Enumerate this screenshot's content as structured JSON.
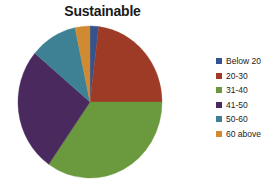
{
  "chart_data": {
    "type": "pie",
    "title": "Sustainable",
    "xlabel": "",
    "ylabel": "",
    "legend_position": "right",
    "grid": false,
    "categories": [
      "Below 20",
      "20-30",
      "31-40",
      "41-50",
      "50-60",
      "60 above"
    ],
    "values": [
      2,
      23,
      35,
      26,
      10,
      4
    ],
    "units": "percent",
    "colors": [
      "#34538F",
      "#9E3B26",
      "#6B993E",
      "#4A2A5E",
      "#3E8195",
      "#D08A32"
    ],
    "start_angle_deg": 0,
    "direction": "clockwise",
    "slices": [
      {
        "label": "Below 20",
        "value": 2,
        "color": "#34538F",
        "start_deg": 0,
        "end_deg": 7
      },
      {
        "label": "20-30",
        "value": 23,
        "color": "#9E3B26",
        "start_deg": 7,
        "end_deg": 90
      },
      {
        "label": "31-40",
        "value": 35,
        "color": "#6B993E",
        "start_deg": 90,
        "end_deg": 215
      },
      {
        "label": "41-50",
        "value": 26,
        "color": "#4A2A5E",
        "start_deg": 215,
        "end_deg": 310
      },
      {
        "label": "50-60",
        "value": 10,
        "color": "#3E8195",
        "start_deg": 310,
        "end_deg": 348
      },
      {
        "label": "60 above",
        "value": 4,
        "color": "#D08A32",
        "start_deg": 348,
        "end_deg": 360
      }
    ]
  },
  "title": {
    "text": "Sustainable"
  },
  "legend": {
    "items": [
      {
        "label": "Below 20",
        "color": "#34538F",
        "swatch_name": "legend-swatch-below-20"
      },
      {
        "label": "20-30",
        "color": "#9E3B26",
        "swatch_name": "legend-swatch-20-30"
      },
      {
        "label": "31-40",
        "color": "#6B993E",
        "swatch_name": "legend-swatch-31-40"
      },
      {
        "label": "41-50",
        "color": "#4A2A5E",
        "swatch_name": "legend-swatch-41-50"
      },
      {
        "label": "50-60",
        "color": "#3E8195",
        "swatch_name": "legend-swatch-50-60"
      },
      {
        "label": "60 above",
        "color": "#D08A32",
        "swatch_name": "legend-swatch-60-above"
      }
    ]
  }
}
